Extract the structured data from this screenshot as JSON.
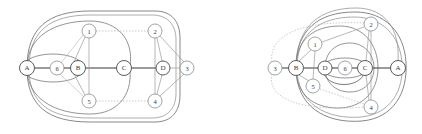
{
  "figure": {
    "type": "graph-embedding-diagram",
    "panel_count": 2,
    "background_color": "#ffffff",
    "stroke_colors": {
      "outer_boundary": "#5a5a5a",
      "primary_edge": "#4a4a4a",
      "secondary_edge": "#9a9a9a",
      "dotted_edge": "#b0b0b0",
      "node_stroke_letter": "#4a4a4a",
      "node_stroke_number": "#8c8c8c",
      "node_fill": "#ffffff",
      "label_color": "#3a3a3a"
    }
  },
  "panels": [
    {
      "id": "left-panel",
      "name": "left-graph",
      "nodes": [
        {
          "id": "A",
          "label": "A",
          "x": 27,
          "y": 68,
          "r": 7.5,
          "kind": "letter"
        },
        {
          "id": "B",
          "label": "B",
          "x": 78,
          "y": 68,
          "r": 7.5,
          "kind": "letter"
        },
        {
          "id": "C",
          "label": "C",
          "x": 124,
          "y": 68,
          "r": 7.5,
          "kind": "letter"
        },
        {
          "id": "D",
          "label": "D",
          "x": 163,
          "y": 68,
          "r": 7.0,
          "kind": "letter"
        },
        {
          "id": "1",
          "label": "1",
          "x": 89,
          "y": 31,
          "r": 7.0,
          "kind": "number"
        },
        {
          "id": "2",
          "label": "2",
          "x": 155,
          "y": 31,
          "r": 7.0,
          "kind": "number"
        },
        {
          "id": "3",
          "label": "3",
          "x": 187,
          "y": 68,
          "r": 7.0,
          "kind": "number"
        },
        {
          "id": "4",
          "label": "4",
          "x": 155,
          "y": 101,
          "r": 7.0,
          "kind": "number"
        },
        {
          "id": "5",
          "label": "5",
          "x": 89,
          "y": 101,
          "r": 7.0,
          "kind": "number"
        },
        {
          "id": "6",
          "label": "6",
          "x": 57,
          "y": 68,
          "r": 7.0,
          "kind": "number"
        }
      ],
      "edges": [
        {
          "from": "A",
          "to": "6",
          "style": "solid-dark"
        },
        {
          "from": "6",
          "to": "B",
          "style": "solid-dark"
        },
        {
          "from": "B",
          "to": "C",
          "style": "solid-dark"
        },
        {
          "from": "C",
          "to": "D",
          "style": "solid-dark"
        },
        {
          "from": "D",
          "to": "3",
          "style": "solid-light"
        },
        {
          "from": "B",
          "to": "1",
          "style": "solid-light"
        },
        {
          "from": "B",
          "to": "5",
          "style": "solid-light"
        },
        {
          "from": "1",
          "to": "2",
          "style": "dotted"
        },
        {
          "from": "5",
          "to": "4",
          "style": "dotted"
        },
        {
          "from": "1",
          "to": "5",
          "style": "solid-light"
        },
        {
          "from": "2",
          "to": "4",
          "style": "solid-light"
        },
        {
          "from": "2",
          "to": "3",
          "style": "solid-light"
        },
        {
          "from": "3",
          "to": "4",
          "style": "solid-light"
        },
        {
          "from": "2",
          "to": "D",
          "style": "solid-light"
        },
        {
          "from": "4",
          "to": "D",
          "style": "solid-light"
        },
        {
          "from": "A",
          "to": "6",
          "style": "arc-upper"
        },
        {
          "from": "A",
          "to": "6",
          "style": "arc-lower"
        },
        {
          "from": "A",
          "to": "1",
          "style": "long-arc"
        },
        {
          "from": "A",
          "to": "C",
          "style": "big-arc"
        },
        {
          "from": "A",
          "to": "5",
          "style": "big-arc-lower"
        },
        {
          "from": "A",
          "to": "2",
          "style": "outer-arc"
        },
        {
          "from": "A",
          "to": "4",
          "style": "outer-arc-lower"
        }
      ],
      "outer_boundary": "rounded-rect",
      "lens_shape": "ellipse-A-B"
    },
    {
      "id": "right-panel",
      "name": "right-graph",
      "nodes": [
        {
          "id": "3",
          "label": "3",
          "x": 275,
          "y": 68,
          "r": 7.0,
          "kind": "number"
        },
        {
          "id": "B",
          "label": "B",
          "x": 296,
          "y": 68,
          "r": 7.5,
          "kind": "letter"
        },
        {
          "id": "D",
          "label": "D",
          "x": 325,
          "y": 68,
          "r": 7.0,
          "kind": "letter"
        },
        {
          "id": "6",
          "label": "6",
          "x": 345,
          "y": 68,
          "r": 7.0,
          "kind": "number"
        },
        {
          "id": "C",
          "label": "C",
          "x": 365,
          "y": 68,
          "r": 7.5,
          "kind": "letter"
        },
        {
          "id": "A",
          "label": "A",
          "x": 398,
          "y": 68,
          "r": 7.5,
          "kind": "letter"
        },
        {
          "id": "1",
          "label": "1",
          "x": 315,
          "y": 44,
          "r": 7.0,
          "kind": "number"
        },
        {
          "id": "2",
          "label": "2",
          "x": 371,
          "y": 24,
          "r": 7.0,
          "kind": "number"
        },
        {
          "id": "5",
          "label": "5",
          "x": 313,
          "y": 86,
          "r": 7.0,
          "kind": "number"
        },
        {
          "id": "4",
          "label": "4",
          "x": 371,
          "y": 107,
          "r": 7.0,
          "kind": "number"
        }
      ],
      "edges": [
        {
          "from": "3",
          "to": "B",
          "style": "solid-dark"
        },
        {
          "from": "B",
          "to": "D",
          "style": "solid-dark"
        },
        {
          "from": "D",
          "to": "6",
          "style": "solid-dark"
        },
        {
          "from": "6",
          "to": "C",
          "style": "solid-dark"
        },
        {
          "from": "C",
          "to": "A",
          "style": "solid-dark"
        },
        {
          "from": "B",
          "to": "1",
          "style": "solid-light"
        },
        {
          "from": "B",
          "to": "5",
          "style": "solid-light"
        },
        {
          "from": "1",
          "to": "2",
          "style": "solid-light"
        },
        {
          "from": "1",
          "to": "5",
          "style": "solid-light"
        },
        {
          "from": "5",
          "to": "4",
          "style": "dotted"
        },
        {
          "from": "2",
          "to": "4",
          "style": "solid-light"
        },
        {
          "from": "2",
          "to": "C",
          "style": "solid-light"
        },
        {
          "from": "4",
          "to": "C",
          "style": "solid-light"
        },
        {
          "from": "3",
          "to": "2",
          "style": "dotted-arc"
        },
        {
          "from": "3",
          "to": "4",
          "style": "dotted-arc-lower"
        },
        {
          "from": "D",
          "to": "C",
          "style": "arc-upper"
        },
        {
          "from": "D",
          "to": "C",
          "style": "arc-lower"
        },
        {
          "from": "B",
          "to": "C",
          "style": "mid-arc"
        },
        {
          "from": "B",
          "to": "A",
          "style": "outer-arc"
        }
      ],
      "outer_boundary": "rounded-blob",
      "lens_shape": "ellipse-D-C"
    }
  ]
}
